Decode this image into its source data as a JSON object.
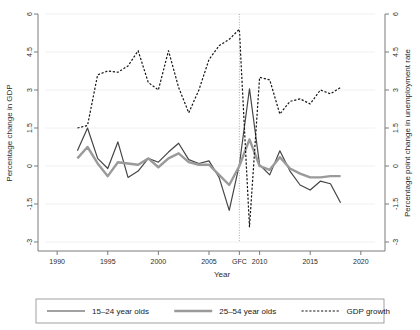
{
  "chart_data": {
    "type": "line",
    "title": "",
    "xlabel": "Year",
    "ylabel": "Percentage change in GDP",
    "y2label": "Percentage point change in unemployment rate",
    "xlim": [
      1988.8,
      2021.4
    ],
    "ylim": [
      -3,
      6
    ],
    "y2lim": [
      -3,
      6
    ],
    "grid": true,
    "grid_axis": "y",
    "legend_position": "bottom-outside",
    "xticks": [
      1990,
      1995,
      2000,
      2005,
      2008,
      2010,
      2015,
      2020
    ],
    "xticklabels": [
      "1990",
      "1995",
      "2000",
      "2005",
      "GFC",
      "2010",
      "2015",
      "2020"
    ],
    "yticks": [
      -3,
      -1.5,
      0,
      1.5,
      3,
      4.5,
      6
    ],
    "yticklabels": [
      "-3",
      "-1.5",
      "0",
      "1.5",
      "3",
      "4.5",
      "6"
    ],
    "y2ticks": [
      -3,
      -1.5,
      0,
      1.5,
      3,
      4.5,
      6
    ],
    "y2ticklabels": [
      "-3",
      "-1.5",
      "0",
      "1.5",
      "3",
      "4.5",
      "6"
    ],
    "annotations": [
      {
        "name": "gfc-marker",
        "type": "vline",
        "x": 2008,
        "label": "GFC",
        "style": "dotted"
      }
    ],
    "series": [
      {
        "name": "15–24 year olds",
        "axis": "left",
        "color": "#454545",
        "style": "solid",
        "width": 1.2,
        "x": [
          1992,
          1993,
          1994,
          1995,
          1996,
          1997,
          1998,
          1999,
          2000,
          2001,
          2002,
          2003,
          2004,
          2005,
          2006,
          2007,
          2008,
          2009,
          2010,
          2011,
          2012,
          2013,
          2014,
          2015,
          2016,
          2017,
          2018
        ],
        "y": [
          0.6,
          1.5,
          0.3,
          -0.1,
          0.95,
          -0.45,
          -0.2,
          0.3,
          0.15,
          0.55,
          0.9,
          0.25,
          0.1,
          0.2,
          -0.45,
          -1.75,
          0.05,
          3.05,
          0.05,
          -0.35,
          0.6,
          -0.2,
          -0.75,
          -0.95,
          -0.6,
          -0.7,
          -1.45
        ]
      },
      {
        "name": "25–54 year olds",
        "axis": "left",
        "color": "#9a9a9a",
        "style": "solid",
        "width": 2.4,
        "x": [
          1992,
          1993,
          1994,
          1995,
          1996,
          1997,
          1998,
          1999,
          2000,
          2001,
          2002,
          2003,
          2004,
          2005,
          2006,
          2007,
          2008,
          2009,
          2010,
          2011,
          2012,
          2013,
          2014,
          2015,
          2016,
          2017,
          2018
        ],
        "y": [
          0.3,
          0.75,
          0.1,
          -0.4,
          0.15,
          0.1,
          0.05,
          0.3,
          -0.05,
          0.3,
          0.5,
          0.15,
          0.05,
          0.05,
          -0.35,
          -0.75,
          0.0,
          1.05,
          0.0,
          -0.15,
          0.35,
          -0.1,
          -0.3,
          -0.45,
          -0.45,
          -0.4,
          -0.4
        ]
      },
      {
        "name": "GDP growth",
        "axis": "right",
        "color": "#151515",
        "style": "dashed",
        "width": 1.2,
        "x": [
          1992,
          1993,
          1994,
          1995,
          1996,
          1997,
          1998,
          1999,
          2000,
          2001,
          2002,
          2003,
          2004,
          2005,
          2006,
          2007,
          2008,
          2009,
          2010,
          2011,
          2012,
          2013,
          2014,
          2015,
          2016,
          2017,
          2018
        ],
        "y": [
          1.5,
          1.6,
          3.6,
          3.75,
          3.7,
          3.95,
          4.55,
          3.3,
          3.0,
          4.55,
          3.1,
          2.1,
          3.0,
          4.2,
          4.75,
          5.0,
          5.4,
          -2.4,
          3.5,
          3.4,
          2.05,
          2.55,
          2.65,
          2.45,
          3.0,
          2.85,
          3.1
        ]
      }
    ],
    "legend_entries": [
      {
        "label": "15–24 year olds",
        "color": "#454545",
        "style": "solid",
        "width": 1.2
      },
      {
        "label": "25–54 year olds",
        "color": "#9a9a9a",
        "style": "solid",
        "width": 2.4
      },
      {
        "label": "GDP growth",
        "color": "#151515",
        "style": "dashed",
        "width": 1.2
      }
    ]
  },
  "axes": {
    "left_title": "Percentage change in GDP",
    "right_title": "Percentage point change in unemployment rate",
    "x_title": "Year"
  },
  "colors": {
    "series_youth": "#454545",
    "series_prime": "#9a9a9a",
    "series_gdp": "#151515",
    "grid": "#f0f0f0",
    "axis": "#7a7a7a",
    "background": "#ffffff",
    "legend_border": "#8a8a8a"
  },
  "legend": {
    "item_0": "15–24 year olds",
    "item_1": "25–54 year olds",
    "item_2": "GDP growth"
  },
  "xticklabels": {
    "t0": "1990",
    "t1": "1995",
    "t2": "2000",
    "t3": "2005",
    "t4": "GFC",
    "t5": "2010",
    "t6": "2015",
    "t7": "2020"
  },
  "yticklabels": {
    "t0": "6",
    "t1": "4.5",
    "t2": "3",
    "t3": "1.5",
    "t4": "0",
    "t5": "-1.5",
    "t6": "-3"
  },
  "y2ticklabels": {
    "t0": "6",
    "t1": "4.5",
    "t2": "3",
    "t3": "1.5",
    "t4": "0",
    "t5": "-1.5",
    "t6": "-3"
  }
}
